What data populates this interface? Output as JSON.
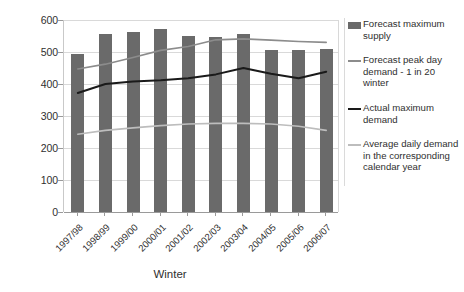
{
  "chart_data": {
    "type": "bar",
    "title": "",
    "xlabel": "Winter",
    "ylabel": "mcm/d",
    "ylim": [
      0,
      600
    ],
    "yticks": [
      0,
      100,
      200,
      300,
      400,
      500,
      600
    ],
    "grid": true,
    "legend_position": "right",
    "categories": [
      "1997/98",
      "1998/99",
      "1999/00",
      "2000/01",
      "2001/02",
      "2002/03",
      "2003/04",
      "2004/05",
      "2005/06",
      "2006/07"
    ],
    "series": [
      {
        "name": "Forecast maximum supply",
        "kind": "bar",
        "color": "#6a6a6a",
        "values": [
          493,
          555,
          562,
          572,
          550,
          548,
          557,
          507,
          507,
          508
        ]
      },
      {
        "name": "Forecast peak day demand - 1 in 20 winter",
        "kind": "line",
        "color": "#8c8c8c",
        "values": [
          447,
          462,
          483,
          505,
          517,
          538,
          541,
          537,
          533,
          530
        ]
      },
      {
        "name": "Actual maximum demand",
        "kind": "line",
        "color": "#1a1a1a",
        "values": [
          372,
          400,
          408,
          412,
          418,
          430,
          450,
          432,
          418,
          438
        ]
      },
      {
        "name": "Average daily demand in the corresponding calendar year",
        "kind": "line",
        "color": "#bdbdbd",
        "values": [
          243,
          255,
          263,
          270,
          275,
          277,
          277,
          275,
          268,
          255
        ]
      }
    ]
  },
  "legend": {
    "items": [
      {
        "label": "Forecast maximum supply",
        "swatch": "bar",
        "color": "#6a6a6a"
      },
      {
        "label": "Forecast peak day demand - 1 in 20 winter",
        "swatch": "line",
        "color": "#8c8c8c"
      },
      {
        "label": "Actual maximum demand",
        "swatch": "line",
        "color": "#1a1a1a"
      },
      {
        "label": "Average daily demand in the corresponding calendar year",
        "swatch": "line",
        "color": "#bdbdbd"
      }
    ]
  }
}
